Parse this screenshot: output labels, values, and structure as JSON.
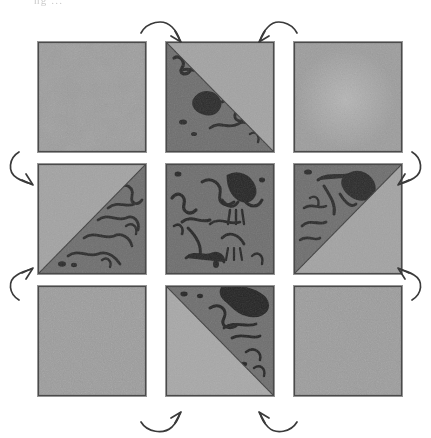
{
  "figure": {
    "caption_fragment": "ng ...",
    "background_color": "#ffffff",
    "grid": {
      "rows": 3,
      "columns": 3,
      "cell_width_px": 108,
      "cell_height_px": 110,
      "column_gap_px": 20,
      "row_gap_px": 12,
      "border_color": "#3c3c3c"
    },
    "palette": {
      "paper": "#ffffff",
      "tile_light": "#9d9d9d",
      "tile_light_alt": "#a6a6a6",
      "tile_dark": "#6e6e6e",
      "tile_dark_deep": "#5c5c5c",
      "mark_ink": "#2b2b2b",
      "mark_ink_soft": "#454545",
      "arrow_ink": "#3a3a3a"
    },
    "cells": [
      {
        "id": "cell-r1-c1",
        "row": 1,
        "col": 1,
        "name": "top-left",
        "pattern": "plain",
        "fill": "light",
        "split": "none",
        "dark_region": "none",
        "marks": 0,
        "description": "Uniform light grey grain, no diagonal, no ink marks."
      },
      {
        "id": "cell-r1-c2",
        "row": 1,
        "col": 2,
        "name": "top-center",
        "pattern": "diagonal-split",
        "fill": "mixed",
        "split": "anti-diagonal",
        "dark_region": "lower-left",
        "marks": 7,
        "description": "Diagonal from top-left to bottom-right; lower-left triangle dark with squiggly ink marks, upper-right light."
      },
      {
        "id": "cell-r1-c3",
        "row": 1,
        "col": 3,
        "name": "top-right",
        "pattern": "plain",
        "fill": "light",
        "split": "none",
        "dark_region": "none",
        "marks": 0,
        "description": "Uniform light grey grain with a faint lighter mottled patch, no marks."
      },
      {
        "id": "cell-r2-c1",
        "row": 2,
        "col": 1,
        "name": "middle-left",
        "pattern": "diagonal-split",
        "fill": "mixed",
        "split": "main-diagonal",
        "dark_region": "lower-right",
        "marks": 8,
        "description": "Diagonal from top-right to bottom-left; lower-right triangle dark with clustered ink marks, upper-left light."
      },
      {
        "id": "cell-r2-c2",
        "row": 2,
        "col": 2,
        "name": "center",
        "pattern": "full-dark",
        "fill": "dark",
        "split": "none",
        "dark_region": "all",
        "marks": 12,
        "description": "Entire tile is dark grey and covered with branching squiggly ink marks."
      },
      {
        "id": "cell-r2-c3",
        "row": 2,
        "col": 3,
        "name": "middle-right",
        "pattern": "diagonal-split",
        "fill": "mixed",
        "split": "main-diagonal",
        "dark_region": "upper-left",
        "marks": 8,
        "description": "Diagonal from top-right to bottom-left; upper-left triangle dark with ink marks, lower-right light."
      },
      {
        "id": "cell-r3-c1",
        "row": 3,
        "col": 1,
        "name": "bottom-left",
        "pattern": "plain",
        "fill": "light",
        "split": "none",
        "dark_region": "none",
        "marks": 0,
        "description": "Uniform light grey grain, no diagonal, no ink marks."
      },
      {
        "id": "cell-r3-c2",
        "row": 3,
        "col": 2,
        "name": "bottom-center",
        "pattern": "diagonal-split",
        "fill": "mixed",
        "split": "anti-diagonal",
        "dark_region": "upper-right",
        "marks": 7,
        "description": "Diagonal from top-left to bottom-right; upper-right triangle dark with heavy ink blots, lower-left light."
      },
      {
        "id": "cell-r3-c3",
        "row": 3,
        "col": 3,
        "name": "bottom-right",
        "pattern": "plain",
        "fill": "light",
        "split": "none",
        "dark_region": "none",
        "marks": 0,
        "description": "Uniform light grey grain, no diagonal, no ink marks."
      }
    ],
    "arrows": [
      {
        "id": "arrow-top-left",
        "side": "top",
        "position": "left-of-center",
        "direction": "curves right then points down-right into top-center tile"
      },
      {
        "id": "arrow-top-right",
        "side": "top",
        "position": "right-of-center",
        "direction": "curves left then points down-left into top-center tile"
      },
      {
        "id": "arrow-left-upper",
        "side": "left",
        "position": "upper",
        "direction": "curves down then points down-right into middle-left tile"
      },
      {
        "id": "arrow-left-lower",
        "side": "left",
        "position": "lower",
        "direction": "curves up then points up-right into middle-left tile"
      },
      {
        "id": "arrow-right-upper",
        "side": "right",
        "position": "upper",
        "direction": "curves down then points down-left into middle-right tile"
      },
      {
        "id": "arrow-right-lower",
        "side": "right",
        "position": "lower",
        "direction": "curves up then points up-left into middle-right tile"
      },
      {
        "id": "arrow-bottom-left",
        "side": "bottom",
        "position": "left-of-center",
        "direction": "curves right then points up-right into bottom-center tile"
      },
      {
        "id": "arrow-bottom-right",
        "side": "bottom",
        "position": "right-of-center",
        "direction": "curves left then points up-left into bottom-center tile"
      }
    ],
    "arrow_count": 8
  }
}
